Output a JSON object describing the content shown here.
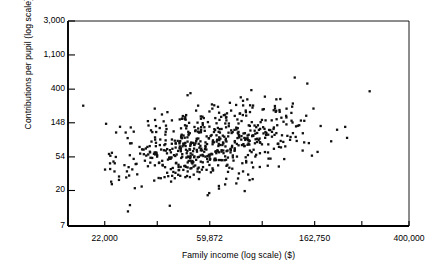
{
  "chart_data": {
    "type": "scatter",
    "title": "",
    "xlabel": "Family income (log scale) ($)",
    "ylabel": "Contributions per pupil (log scale) ($)",
    "x_scale": "log",
    "y_scale": "log",
    "grid": false,
    "legend": null,
    "marker": {
      "shape": "square",
      "size_px": 2.3,
      "color": "#101010"
    },
    "frame": {
      "left_px": 68,
      "right_px": 409,
      "top_px": 21,
      "bottom_px": 226
    },
    "xlim": [
      15500,
      400000
    ],
    "ylim": [
      7,
      3000
    ],
    "xticks_labeled": [
      "22,000",
      "59,872",
      "162,750",
      "400,000"
    ],
    "xtick_values": [
      22000,
      59872,
      162750,
      400000
    ],
    "xticks_minor_count": 4,
    "yticks_labeled": [
      "3,000",
      "1,100",
      "400",
      "148",
      "54",
      "20",
      "7"
    ],
    "ytick_values": [
      3000,
      1100,
      400,
      148,
      54,
      20,
      7
    ],
    "n_points": 620,
    "cluster": {
      "center_x": 62000,
      "center_y": 80,
      "spread_x_log": 0.42,
      "spread_y_log": 0.62,
      "correlation": 0.38
    }
  },
  "axis": {
    "y_label": "Contributions per pupil (log scale) ($)",
    "x_label": "Family income (log scale) ($)"
  }
}
